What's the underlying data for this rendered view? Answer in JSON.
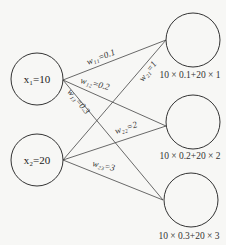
{
  "diagram": {
    "type": "neural-network-forward-pass",
    "inputs": [
      {
        "id": "x1",
        "label": "x₁=10",
        "value": 10
      },
      {
        "id": "x2",
        "label": "x₂=20",
        "value": 20
      }
    ],
    "outputs": [
      {
        "id": "o1",
        "label": "10 × 0.1+20 × 1"
      },
      {
        "id": "o2",
        "label": "10 × 0.2+20 × 2"
      },
      {
        "id": "o3",
        "label": "10 × 0.3+20 × 3"
      }
    ],
    "weights": [
      {
        "from": "x1",
        "to": "o1",
        "label": "w₁₁=0.1",
        "value": 0.1
      },
      {
        "from": "x1",
        "to": "o2",
        "label": "w₁₂=0.2",
        "value": 0.2
      },
      {
        "from": "x1",
        "to": "o3",
        "label": "w₁₃=0.3",
        "value": 0.3
      },
      {
        "from": "x2",
        "to": "o1",
        "label": "w₂₁=1",
        "value": 1
      },
      {
        "from": "x2",
        "to": "o2",
        "label": "w₂₂=2",
        "value": 2
      },
      {
        "from": "x2",
        "to": "o3",
        "label": "w₂₃=3",
        "value": 3
      }
    ]
  }
}
